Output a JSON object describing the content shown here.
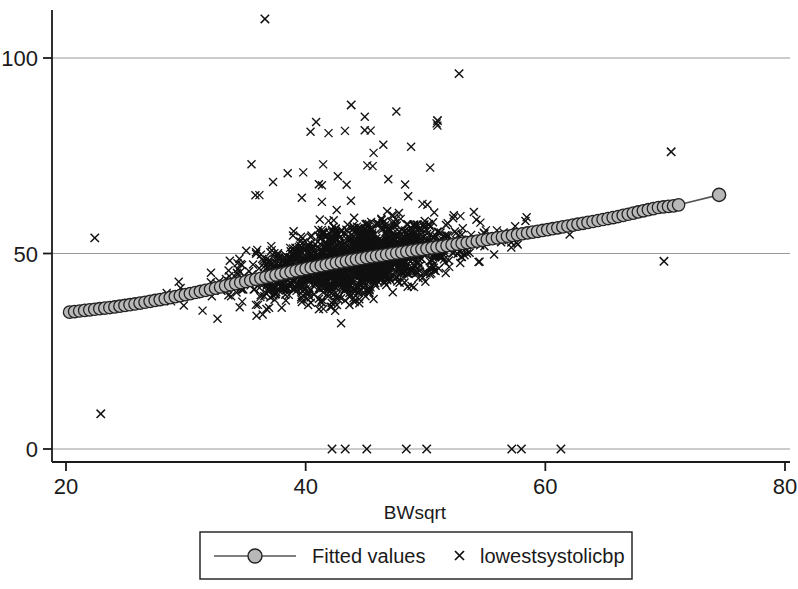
{
  "chart_data": {
    "type": "scatter",
    "title": "",
    "xlabel": "BWsqrt",
    "ylabel": "",
    "xlim": [
      20,
      80
    ],
    "ylim": [
      0,
      115
    ],
    "x_ticks": [
      20,
      40,
      60,
      80
    ],
    "y_ticks": [
      0,
      50,
      100
    ],
    "gridlines": {
      "horizontal": true,
      "vertical": false
    },
    "legend": {
      "position": "bottom-center",
      "entries": [
        {
          "label": "Fitted values",
          "marker": "circle-line",
          "color": "#b0b0b0",
          "line_color": "#555555"
        },
        {
          "label": "lowestsystolicbp",
          "marker": "x",
          "color": "#111111"
        }
      ]
    },
    "series": [
      {
        "name": "lowestsystolicbp",
        "type": "scatter",
        "marker": "x",
        "color": "#111111",
        "n_points": 1800,
        "description": "Dense cloud of observed lowest systolic BP vs BWsqrt, rising from ~35 at BWsqrt 20 to ~60 at BWsqrt 70, with vertical spread widening in the middle range and a band of zero values near BWsqrt 42-62.",
        "notable_points": [
          {
            "x": 36.6,
            "y": 110
          },
          {
            "x": 52.8,
            "y": 96
          },
          {
            "x": 43.8,
            "y": 88
          },
          {
            "x": 51.0,
            "y": 84
          },
          {
            "x": 22.4,
            "y": 54
          },
          {
            "x": 22.9,
            "y": 9
          },
          {
            "x": 69.9,
            "y": 48
          },
          {
            "x": 70.5,
            "y": 76
          }
        ],
        "zero_points_x": [
          42.2,
          43.3,
          45.1,
          48.4,
          50.1,
          57.2,
          58.0,
          61.3
        ]
      },
      {
        "name": "Fitted values",
        "type": "line-markers",
        "marker": "circle",
        "marker_face": "#b8b8b8",
        "marker_edge": "#222222",
        "line_color": "#555555",
        "description": "Lowess/fitted curve, nearly linear, rising steadily across the x range.",
        "points": [
          {
            "x": 20.3,
            "y": 35.0
          },
          {
            "x": 22.0,
            "y": 35.6
          },
          {
            "x": 24.0,
            "y": 36.3
          },
          {
            "x": 26.0,
            "y": 37.2
          },
          {
            "x": 28.0,
            "y": 38.3
          },
          {
            "x": 30.0,
            "y": 39.5
          },
          {
            "x": 32.0,
            "y": 40.8
          },
          {
            "x": 34.0,
            "y": 42.2
          },
          {
            "x": 36.0,
            "y": 43.5
          },
          {
            "x": 38.0,
            "y": 44.8
          },
          {
            "x": 40.0,
            "y": 46.1
          },
          {
            "x": 42.0,
            "y": 47.3
          },
          {
            "x": 44.0,
            "y": 48.4
          },
          {
            "x": 46.0,
            "y": 49.4
          },
          {
            "x": 48.0,
            "y": 50.3
          },
          {
            "x": 50.0,
            "y": 51.2
          },
          {
            "x": 52.0,
            "y": 52.1
          },
          {
            "x": 54.0,
            "y": 53.0
          },
          {
            "x": 56.0,
            "y": 54.0
          },
          {
            "x": 58.0,
            "y": 55.0
          },
          {
            "x": 60.0,
            "y": 56.0
          },
          {
            "x": 62.0,
            "y": 57.1
          },
          {
            "x": 64.0,
            "y": 58.2
          },
          {
            "x": 66.0,
            "y": 59.4
          },
          {
            "x": 68.0,
            "y": 60.8
          },
          {
            "x": 69.5,
            "y": 61.8
          },
          {
            "x": 70.8,
            "y": 62.2
          },
          {
            "x": 74.5,
            "y": 65.0
          }
        ]
      }
    ]
  },
  "axes": {
    "x_tick_labels": [
      "20",
      "40",
      "60",
      "80"
    ],
    "y_tick_labels": [
      "0",
      "50",
      "100"
    ],
    "x_axis_title": "BWsqrt"
  },
  "legend": {
    "fitted_label": "Fitted values",
    "scatter_label": "lowestsystolicbp"
  },
  "colors": {
    "axis": "#1a1a1a",
    "grid": "#9a9a9a",
    "scatter": "#111111",
    "fit_marker_face": "#b8b8b8",
    "fit_marker_edge": "#222222",
    "fit_line": "#555555",
    "background": "#ffffff"
  }
}
